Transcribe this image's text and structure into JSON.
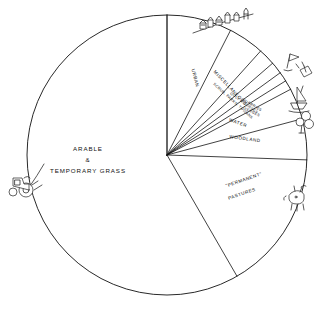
{
  "chart_data": {
    "type": "pie",
    "title": "",
    "subtitle": "",
    "xlabel": "",
    "ylabel": "",
    "legend_position": "none",
    "grid": false,
    "labels_on_slices": true,
    "start_angle_deg": 0,
    "direction": "clockwise",
    "categories": [
      "ARABLE & TEMPORARY GRASS",
      "URBAN",
      "MISCELLANEOUS",
      "SCRUB, PARKS, TOWANS",
      "GOLF COURSES",
      "QUARRIES",
      "VERGES",
      "WATER",
      "WOODLAND",
      "\"PERMANENT\" PASTURES"
    ],
    "values": [
      58.3,
      7.5,
      4.2,
      1.9,
      1.4,
      1.1,
      1.1,
      3.6,
      4.7,
      16.1
    ],
    "slices": [
      {
        "label": "URBAN",
        "start_deg": 0,
        "end_deg": 27,
        "value": 7.5
      },
      {
        "label": "MISCELLANEOUS",
        "start_deg": 27,
        "end_deg": 42,
        "value": 4.2
      },
      {
        "label": "SCRUB, PARKS, TOWANS",
        "start_deg": 42,
        "end_deg": 49,
        "value": 1.9
      },
      {
        "label": "GOLF COURSES",
        "start_deg": 49,
        "end_deg": 54,
        "value": 1.4
      },
      {
        "label": "QUARRIES",
        "start_deg": 54,
        "end_deg": 58,
        "value": 1.1
      },
      {
        "label": "VERGES",
        "start_deg": 58,
        "end_deg": 62,
        "value": 1.1
      },
      {
        "label": "WATER",
        "start_deg": 62,
        "end_deg": 75,
        "value": 3.6
      },
      {
        "label": "WOODLAND",
        "start_deg": 75,
        "end_deg": 92,
        "value": 4.7
      },
      {
        "label": "\"PERMANENT\" PASTURES",
        "start_deg": 92,
        "end_deg": 150,
        "value": 16.1
      },
      {
        "label": "ARABLE & TEMPORARY GRASS",
        "start_deg": 150,
        "end_deg": 360,
        "value": 58.3
      }
    ]
  },
  "labels": {
    "arable_line1": "ARABLE",
    "arable_line2": "&",
    "arable_line3": "TEMPORARY  GRASS",
    "urban": "URBAN",
    "miscellaneous": "MISCELLANEOUS",
    "scrub": "SCRUB, PARKS, TOWANS",
    "golf": "GOLF  COURSES",
    "quarries": "QUARRIES",
    "verges": "VERGES",
    "water": "WATER",
    "woodland": "WOODLAND",
    "pastures_line1": "\"PERMANENT\"",
    "pastures_line2": "PASTURES"
  },
  "decorations": [
    {
      "name": "townscape-sketch",
      "position": "top",
      "depicts": "row of houses and buildings"
    },
    {
      "name": "golf-flag-sketch",
      "position": "upper-right",
      "depicts": "golf flag and hole"
    },
    {
      "name": "sailboat-sketch",
      "position": "right-upper",
      "depicts": "sailing dinghy on water"
    },
    {
      "name": "tree-sketch",
      "position": "right",
      "depicts": "broadleaf tree"
    },
    {
      "name": "cattle-sketch",
      "position": "lower-right",
      "depicts": "grazing cow"
    },
    {
      "name": "tractor-sketch",
      "position": "left",
      "depicts": "tractor ploughing"
    }
  ],
  "style": {
    "background": "#ffffff",
    "stroke": "#111111"
  }
}
